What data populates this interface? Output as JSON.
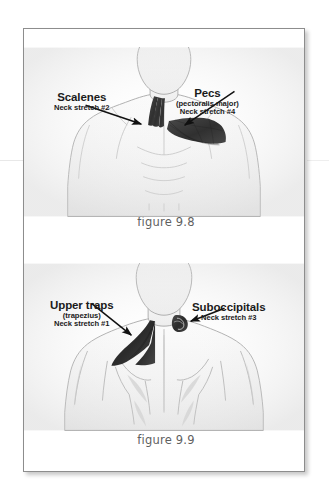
{
  "page": {
    "type": "scanned-book-page",
    "background_color": "#ffffff",
    "sheet_border_color": "#8d8d8d"
  },
  "figures": [
    {
      "id": "9.8",
      "caption": "figure 9.8",
      "view": "anterior",
      "description": "Front view of a male head, neck and torso with two muscle groups shaded dark",
      "callouts": [
        {
          "name": "scalenes",
          "title": "Scalenes",
          "subtitle": "",
          "stretch": "Neck stretch #2",
          "side": "left",
          "arrow": "points right-down to the side of the neck"
        },
        {
          "name": "pecs",
          "title": "Pecs",
          "subtitle": "(pectoralis major)",
          "stretch": "Neck stretch #4",
          "side": "right",
          "arrow": "points left-down to the upper chest"
        }
      ]
    },
    {
      "id": "9.9",
      "caption": "figure 9.9",
      "view": "posterior",
      "description": "Back view of a male head, neck and upper back with two muscle groups shaded dark",
      "callouts": [
        {
          "name": "upper-traps",
          "title": "Upper traps",
          "subtitle": "(trapezius)",
          "stretch": "Neck stretch #1",
          "side": "left",
          "arrow": "points right-down to the base of the neck and shoulder"
        },
        {
          "name": "suboccipitals",
          "title": "Suboccipitals",
          "subtitle": "",
          "stretch": "Neck stretch #3",
          "side": "right",
          "arrow": "points left to the base of the skull"
        }
      ]
    }
  ],
  "colors": {
    "muscle_shade": "#3a3a3a",
    "body_outline": "#8f8f8f",
    "label_text": "#1b1b1b",
    "caption_text": "#5f5f5f",
    "arrow": "#111111"
  }
}
